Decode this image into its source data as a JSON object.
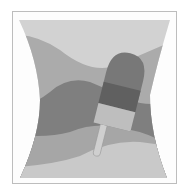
{
  "image": {
    "subject": "popsicle on wavy striped background",
    "colors": {
      "frame_border": "#bdbdbd",
      "background": "#fdfdfd",
      "band_light_top": "#d2d2d2",
      "band_mid": "#ababab",
      "band_dark": "#7f7f7f",
      "band_lower_mid": "#a6a6a6",
      "band_bottom_light": "#c9c9c9",
      "popsicle_top": "#787878",
      "popsicle_middle": "#606060",
      "popsicle_bottom": "#bebebe",
      "stick": "#cfcfcf"
    }
  }
}
